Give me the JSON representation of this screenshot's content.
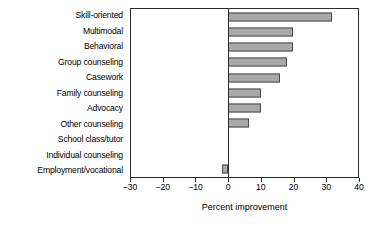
{
  "chart_data": {
    "type": "bar",
    "orientation": "horizontal",
    "title": "",
    "xlabel": "Percent improvement",
    "ylabel": "",
    "xlim": [
      -30,
      40
    ],
    "xticks": [
      -30,
      -20,
      -10,
      0,
      10,
      20,
      30,
      40
    ],
    "xticklabels": [
      "−30",
      "−20",
      "−10",
      "0",
      "10",
      "20",
      "30",
      "40"
    ],
    "grid": false,
    "legend": null,
    "categories": [
      "Skill-oriented",
      "Multimodal",
      "Behavioral",
      "Group counseling",
      "Casework",
      "Family counseling",
      "Advocacy",
      "Other counseling",
      "School class/tutor",
      "Individual counseling",
      "Employment/vocational"
    ],
    "values": [
      32,
      20,
      20,
      18,
      16,
      10,
      10,
      6.5,
      0,
      0,
      -2
    ],
    "bar_fill_color": "#a9a9a9",
    "bar_edge_color": "#4a4a4a",
    "axis_color": "#2b2b2b",
    "background_color": "#ffffff"
  }
}
